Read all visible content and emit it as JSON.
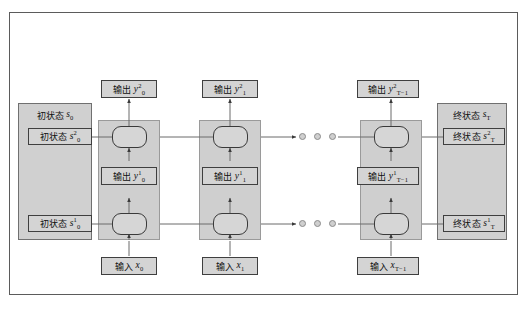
{
  "diagram": {
    "colors": {
      "frame_border": "#5b5b5b",
      "box_fill": "#d4d4d4",
      "box_border": "#3f3f3f",
      "band_fill": "#cfcfcf",
      "cell_border": "#3a3a3a",
      "wire": "#6b6b6b",
      "background": "#ffffff"
    }
  },
  "initial_state": {
    "caption_cjk": "初状态",
    "caption_var": "s",
    "caption_sub": "0",
    "layer2": {
      "cjk": "初状态",
      "var": "s",
      "sup": "2",
      "sub": "0"
    },
    "layer1": {
      "cjk": "初状态",
      "var": "s",
      "sup": "1",
      "sub": "0"
    }
  },
  "terminal_state": {
    "caption_cjk": "终状态",
    "caption_var": "s",
    "caption_sub": "T",
    "layer2": {
      "cjk": "终状态",
      "var": "s",
      "sup": "2",
      "sub": "T"
    },
    "layer1": {
      "cjk": "终状态",
      "var": "s",
      "sup": "1",
      "sub": "T"
    }
  },
  "timesteps": [
    {
      "id": "t0",
      "output_top": {
        "cjk": "输出",
        "var": "y",
        "sup": "2",
        "sub": "0"
      },
      "output_mid": {
        "cjk": "输出",
        "var": "y",
        "sup": "1",
        "sub": "0"
      },
      "input": {
        "cjk": "输入",
        "var": "x",
        "sub": "0"
      }
    },
    {
      "id": "t1",
      "output_top": {
        "cjk": "输出",
        "var": "y",
        "sup": "2",
        "sub": "1"
      },
      "output_mid": {
        "cjk": "输出",
        "var": "y",
        "sup": "1",
        "sub": "1"
      },
      "input": {
        "cjk": "输入",
        "var": "x",
        "sub": "1"
      }
    },
    {
      "id": "tT-1",
      "output_top": {
        "cjk": "输出",
        "var": "y",
        "sup": "2",
        "sub": "T−1"
      },
      "output_mid": {
        "cjk": "输出",
        "var": "y",
        "sup": "1",
        "sub": "T−1"
      },
      "input": {
        "cjk": "输入",
        "var": "x",
        "sub": "T−1"
      }
    }
  ],
  "ellipsis": {
    "count": 3,
    "rows": [
      "layer2-gap",
      "layer1-gap"
    ]
  }
}
